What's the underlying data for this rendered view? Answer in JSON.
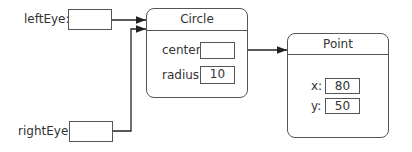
{
  "variables": [
    {
      "label": "leftEye:",
      "value": ""
    },
    {
      "label": "rightEye:",
      "value": ""
    }
  ],
  "circle": {
    "title": "Circle",
    "fields": [
      {
        "label": "center:",
        "value": ""
      },
      {
        "label": "radius:",
        "value": "10"
      }
    ]
  },
  "point": {
    "title": "Point",
    "fields": [
      {
        "label": "x:",
        "value": "80"
      },
      {
        "label": "y:",
        "value": "50"
      }
    ]
  },
  "colors": {
    "line": "#222222",
    "border": "#555555"
  }
}
